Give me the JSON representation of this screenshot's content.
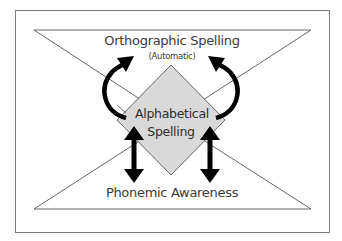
{
  "diagram": {
    "top_label": "Orthographic Spelling",
    "top_sublabel": "(Automatic)",
    "center_label_line1": "Alphabetical",
    "center_label_line2": "Spelling",
    "bottom_label": "Phonemic Awareness"
  },
  "colors": {
    "frame": "#7a7a7a",
    "triangle_stroke": "#555555",
    "diamond_fill": "#d9d9d9",
    "arrow": "#000000",
    "text": "#3a3a3a"
  }
}
